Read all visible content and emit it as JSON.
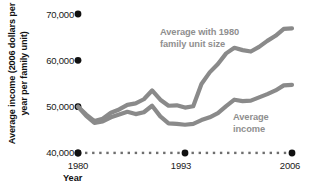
{
  "chart_data": {
    "type": "line",
    "title": "",
    "xlabel": "Year",
    "ylabel": "Average income (2006 dollars per year per family unit)",
    "xlim": [
      1980,
      2006
    ],
    "ylim": [
      40000,
      72000
    ],
    "grid": false,
    "legend_position": "inline-annotations",
    "xticks": [
      1980,
      1993,
      2006
    ],
    "xtick_labels": [
      "1980",
      "1993",
      "2006"
    ],
    "yticks": [
      40000,
      50000,
      60000,
      70000
    ],
    "ytick_labels": [
      "40,000",
      "50,000",
      "60,000",
      "70,000"
    ],
    "line_color": "#8a8a8a",
    "axis_dot_color": "#111111",
    "x": [
      1980,
      1981,
      1982,
      1983,
      1984,
      1985,
      1986,
      1987,
      1988,
      1989,
      1990,
      1991,
      1992,
      1993,
      1994,
      1995,
      1996,
      1997,
      1998,
      1999,
      2000,
      2001,
      2002,
      2003,
      2004,
      2005,
      2006
    ],
    "series": [
      {
        "name": "Average with 1980 family unit size",
        "annotation": "Average with 1980\nfamily unit size",
        "values": [
          50000,
          48300,
          46900,
          47400,
          48700,
          49400,
          50400,
          50700,
          51600,
          53500,
          51500,
          50200,
          50300,
          49800,
          50100,
          54900,
          57400,
          59200,
          61500,
          62700,
          62200,
          61900,
          62900,
          64200,
          65300,
          66800,
          66900
        ]
      },
      {
        "name": "Average income",
        "annotation": "Average\nincome",
        "values": [
          50000,
          48000,
          46500,
          46800,
          47700,
          48300,
          48900,
          48400,
          48800,
          50200,
          47900,
          46400,
          46300,
          46100,
          46300,
          47100,
          47700,
          48600,
          50100,
          51500,
          51200,
          51300,
          52000,
          52700,
          53500,
          54600,
          54700
        ]
      }
    ]
  }
}
